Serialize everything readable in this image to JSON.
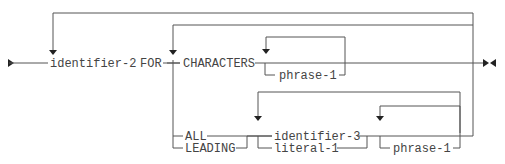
{
  "diagram": {
    "type": "syntax-diagram",
    "terms": {
      "identifier_2": "identifier-2",
      "for": "FOR",
      "characters": "CHARACTERS",
      "phrase_1a": "phrase-1",
      "all": "ALL",
      "leading": "LEADING",
      "identifier_3": "identifier-3",
      "literal_1": "literal-1",
      "phrase_1b": "phrase-1"
    }
  }
}
